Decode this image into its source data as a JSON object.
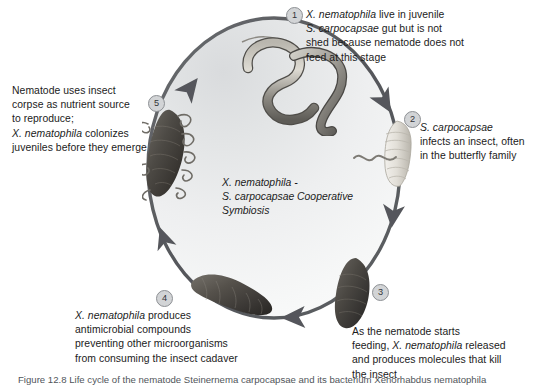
{
  "figure": {
    "center_label": "X. nematophila -\nS. carpocapsae Cooperative\nSymbiosis",
    "ring_color": "#58595b",
    "field_color": "#e6e7e8",
    "badge_color": "#d2d4d6"
  },
  "steps": [
    {
      "number": "1",
      "text_lines": [
        "X. nematophila live in juvenile",
        "S. carpocapsae gut but is not",
        "shed because nematode does not",
        "feed at this stage"
      ],
      "text": "X. nematophila live in juvenile\nS. carpocapsae gut but is not\nshed because nematode does not\nfeed at this stage",
      "organism": "nematode-juvenile"
    },
    {
      "number": "2",
      "text_lines": [
        "S. carpocapsae",
        "infects an insect, often",
        "in the butterfly family"
      ],
      "text": "S. carpocapsae\ninfects an insect, often\nin the butterfly family",
      "organism": "caterpillar-larva"
    },
    {
      "number": "3",
      "text_lines": [
        "As the nematode starts",
        "feeding, X. nematophila released",
        "and produces molecules that kill",
        "the insect"
      ],
      "text": "As the nematode starts\nfeeding, X. nematophila released\nand produces molecules that kill\nthe insect",
      "organism": "insect-cadaver-right"
    },
    {
      "number": "4",
      "text_lines": [
        "X. nematophila produces",
        "antimicrobial compounds",
        "preventing other microorganisms",
        "from consuming the insect cadaver"
      ],
      "text": "X. nematophila produces\nantimicrobial compounds\npreventing other microorganisms\nfrom consuming the insect cadaver",
      "organism": "insect-cadaver-bottom"
    },
    {
      "number": "5",
      "text_lines": [
        "Nematode uses insect",
        "corpse as nutrient source",
        "to reproduce;",
        "X. nematophila colonizes",
        "juveniles before they emerge"
      ],
      "text": "Nematode uses insect\ncorpse as nutrient source\nto reproduce;\nX. nematophila colonizes\njuveniles before they emerge",
      "organism": "insect-cadaver-left"
    }
  ],
  "caption": {
    "text": "Figure 12.8   Life cycle of the nematode Steinernema carpocapsae and its bacterium Xenorhabdus nematophila"
  }
}
